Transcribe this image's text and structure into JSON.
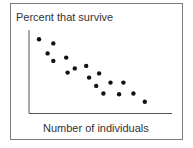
{
  "chart_data": {
    "type": "scatter",
    "title": "",
    "xlabel": "Number of individuals",
    "ylabel": "Percent that survive",
    "xlim": [
      0,
      100
    ],
    "ylim": [
      0,
      100
    ],
    "grid": false,
    "legend": null,
    "ticks": false,
    "points": [
      {
        "x": 7,
        "y": 89
      },
      {
        "x": 17,
        "y": 84
      },
      {
        "x": 13,
        "y": 72
      },
      {
        "x": 17,
        "y": 63
      },
      {
        "x": 26,
        "y": 67
      },
      {
        "x": 27,
        "y": 49
      },
      {
        "x": 32,
        "y": 54
      },
      {
        "x": 40,
        "y": 57
      },
      {
        "x": 42,
        "y": 43
      },
      {
        "x": 49,
        "y": 48
      },
      {
        "x": 47,
        "y": 33
      },
      {
        "x": 52,
        "y": 24
      },
      {
        "x": 57,
        "y": 37
      },
      {
        "x": 66,
        "y": 37
      },
      {
        "x": 63,
        "y": 23
      },
      {
        "x": 73,
        "y": 24
      },
      {
        "x": 81,
        "y": 14
      }
    ]
  }
}
